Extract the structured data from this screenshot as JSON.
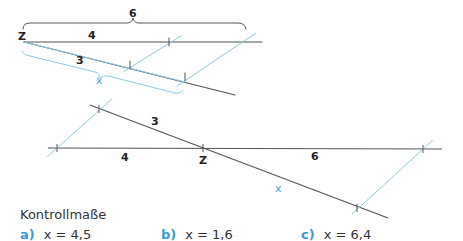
{
  "colors": {
    "line": "#555555",
    "construction": "#8ccbe8",
    "accent": "#3b9ad6"
  },
  "top_figure": {
    "labels": {
      "brace_total": "6",
      "center": "Z",
      "segment_a": "4",
      "segment_b": "3",
      "unknown": "x"
    }
  },
  "bottom_figure": {
    "labels": {
      "segment_b": "3",
      "segment_a": "4",
      "center": "Z",
      "segment_c": "6",
      "unknown": "x"
    }
  },
  "answers": {
    "title": "Kontrollmaße",
    "items": [
      {
        "letter": "a)",
        "text": "x = 4,5"
      },
      {
        "letter": "b)",
        "text": "x = 1,6"
      },
      {
        "letter": "c)",
        "text": "x = 6,4"
      }
    ]
  }
}
